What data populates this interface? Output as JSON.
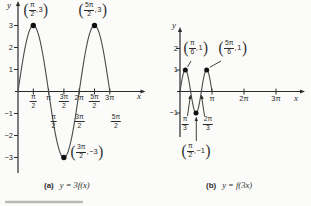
{
  "figure": {
    "background": "#fbfbf9",
    "ink_color": "#2b2b2b",
    "curve_color": "#4a4a4a",
    "divider_color": "#b9b9b6"
  },
  "captions": {
    "a": {
      "tag": "(a)",
      "formula": "y = 3f(x)"
    },
    "b": {
      "tag": "(b)",
      "formula": "y = f(3x)"
    }
  },
  "chart_data": [
    {
      "panel": "a",
      "type": "line",
      "title": "y = 3f(x)",
      "function": "y = 3 sin x",
      "xlabel": "x",
      "ylabel": "y",
      "amplitude": 3,
      "frequency_multiplier": 1,
      "period": "2π",
      "x_domain_pi": [
        0,
        3
      ],
      "ylim": [
        -3,
        3
      ],
      "x_ticks": [
        {
          "num": "π",
          "den": "2",
          "pi": 0.5
        },
        {
          "text": "π",
          "pi": 1
        },
        {
          "num": "3π",
          "den": "2",
          "pi": 1.5
        },
        {
          "text": "2π",
          "pi": 2
        },
        {
          "num": "5π",
          "den": "2",
          "pi": 2.5
        },
        {
          "text": "3π",
          "pi": 3
        }
      ],
      "x_ticks_secondary": [
        {
          "num": "π",
          "den": "2"
        },
        {
          "num": "3π",
          "den": "2"
        },
        {
          "num": "5π",
          "den": "2"
        }
      ],
      "y_ticks": [
        {
          "text": "3",
          "v": 3
        },
        {
          "text": "2",
          "v": 2
        },
        {
          "text": "1",
          "v": 1
        },
        {
          "text": "−1",
          "v": -1
        },
        {
          "text": "−2",
          "v": -2
        },
        {
          "text": "−3",
          "v": -3
        }
      ],
      "points": [
        {
          "x_pi": 0.5,
          "y": 3,
          "label": {
            "num": "π",
            "den": "2",
            "value": "3"
          }
        },
        {
          "x_pi": 2.5,
          "y": 3,
          "label": {
            "num": "5π",
            "den": "2",
            "value": "3"
          }
        },
        {
          "x_pi": 1.5,
          "y": -3,
          "label": {
            "num": "3π",
            "den": "2",
            "value": "−3"
          }
        }
      ]
    },
    {
      "panel": "b",
      "type": "line",
      "title": "y = f(3x)",
      "function": "y = sin 3x",
      "xlabel": "x",
      "ylabel": "y",
      "amplitude": 1,
      "frequency_multiplier": 3,
      "period": "2π/3",
      "x_domain_pi": [
        0,
        1
      ],
      "ylim": [
        -1,
        2
      ],
      "x_ticks": [
        {
          "text": "π",
          "pi": 1
        },
        {
          "text": "2π",
          "pi": 2
        },
        {
          "text": "3π",
          "pi": 3
        }
      ],
      "x_ticks_secondary": [
        {
          "num": "π",
          "den": "3"
        },
        {
          "num": "2π",
          "den": "3"
        }
      ],
      "y_ticks": [
        {
          "text": "2",
          "v": 2
        },
        {
          "text": "1",
          "v": 1
        },
        {
          "text": "−1",
          "v": -1
        }
      ],
      "points": [
        {
          "x_pi": 0.16667,
          "y": 1,
          "label": {
            "num": "π",
            "den": "6",
            "value": "1"
          }
        },
        {
          "x_pi": 0.83333,
          "y": 1,
          "label": {
            "num": "5π",
            "den": "6",
            "value": "1"
          }
        },
        {
          "x_pi": 0.5,
          "y": -1,
          "label": {
            "num": "π",
            "den": "2",
            "value": "−1"
          }
        }
      ]
    }
  ]
}
